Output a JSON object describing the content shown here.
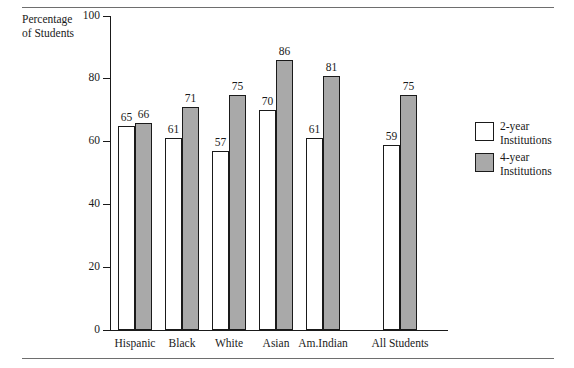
{
  "figure": {
    "clipped_caption_above": "",
    "axis_title_line1": "Percentage",
    "axis_title_line2": "of Students"
  },
  "legend": {
    "items": [
      {
        "swatch": "white-square-swatch",
        "line1": "2-year",
        "line2": "Institutions",
        "color": "#ffffff"
      },
      {
        "swatch": "gray-square-swatch",
        "line1": "4-year",
        "line2": "Institutions",
        "color": "#a9a9a9"
      }
    ]
  },
  "chart_data": {
    "type": "bar",
    "title": "",
    "subtitle": "",
    "xlabel": "",
    "ylabel": "Percentage of Students",
    "ylim": [
      0,
      100
    ],
    "yticks": [
      0,
      20,
      40,
      60,
      80,
      100
    ],
    "ytick_labels": [
      "0",
      "20",
      "40",
      "60",
      "80",
      "100"
    ],
    "grid": false,
    "legend_position": "right",
    "categories": [
      "Hispanic",
      "Black",
      "White",
      "Asian",
      "Am.Indian",
      "All Students"
    ],
    "series": [
      {
        "name": "2-year Institutions",
        "color": "#ffffff",
        "values": [
          65,
          61,
          57,
          70,
          61,
          59
        ]
      },
      {
        "name": "4-year Institutions",
        "color": "#a9a9a9",
        "values": [
          66,
          71,
          75,
          86,
          81,
          75
        ]
      }
    ],
    "value_labels": [
      [
        "65",
        "61",
        "57",
        "70",
        "61",
        "59"
      ],
      [
        "66",
        "71",
        "75",
        "86",
        "81",
        "75"
      ]
    ]
  }
}
